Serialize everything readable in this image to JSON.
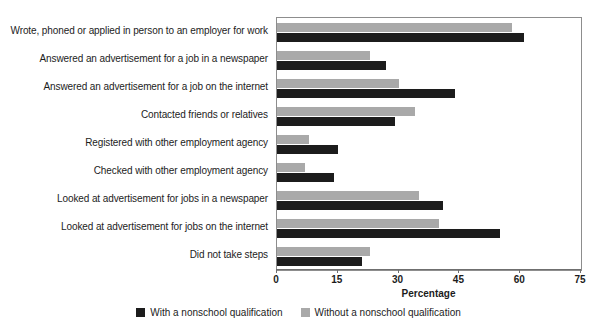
{
  "chart_data": {
    "type": "bar",
    "orientation": "horizontal",
    "title": "",
    "xlabel": "Percentage",
    "ylabel": "",
    "xlim": [
      0,
      75
    ],
    "xticks": [
      0,
      15,
      30,
      45,
      60,
      75
    ],
    "xtick_labels": [
      "0",
      "15",
      "30",
      "45",
      "60",
      "75"
    ],
    "grid": false,
    "legend_position": "bottom-center",
    "categories": [
      "Wrote, phoned or applied in person to an employer for work",
      "Answered an advertisement for a job in a newspaper",
      "Answered an advertisement for a job on the internet",
      "Contacted friends or relatives",
      "Registered with other employment agency",
      "Checked with other employment agency",
      "Looked at advertisement for jobs in a newspaper",
      "Looked at advertisement for jobs on the internet",
      "Did not take steps"
    ],
    "series": [
      {
        "name": "Without a nonschool qualification",
        "color": "#a9a9a9",
        "values": [
          58,
          23,
          30,
          34,
          8,
          7,
          35,
          40,
          23
        ]
      },
      {
        "name": "With a nonschool qualification",
        "color": "#1c1c1c",
        "values": [
          61,
          27,
          44,
          29,
          15,
          14,
          41,
          55,
          21
        ]
      }
    ]
  },
  "legend": {
    "items": [
      {
        "label": "With a nonschool qualification",
        "color": "#1c1c1c",
        "swatch_name": "legend-swatch-dark"
      },
      {
        "label": "Without a nonschool qualification",
        "color": "#a9a9a9",
        "swatch_name": "legend-swatch-light"
      }
    ]
  }
}
